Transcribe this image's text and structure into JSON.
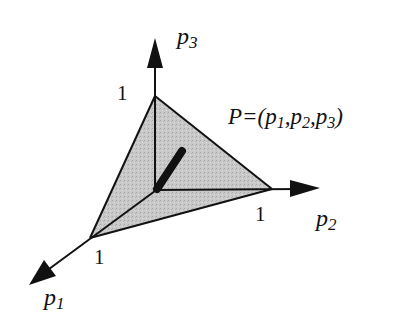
{
  "diagram": {
    "axes": {
      "p1": {
        "label": "p",
        "subscript": "1",
        "tick": "1"
      },
      "p2": {
        "label": "p",
        "subscript": "2",
        "tick": "1"
      },
      "p3": {
        "label": "p",
        "subscript": "3",
        "tick": "1"
      }
    },
    "point_label": {
      "prefix": "P=(",
      "p1": "p",
      "s1": "1",
      "sep1": ",",
      "p2": "p",
      "s2": "2",
      "sep2": ",",
      "p3": "p",
      "s3": "3",
      "suffix": ")"
    },
    "colors": {
      "fill": "#c8c8c8",
      "stroke": "#111111"
    }
  }
}
